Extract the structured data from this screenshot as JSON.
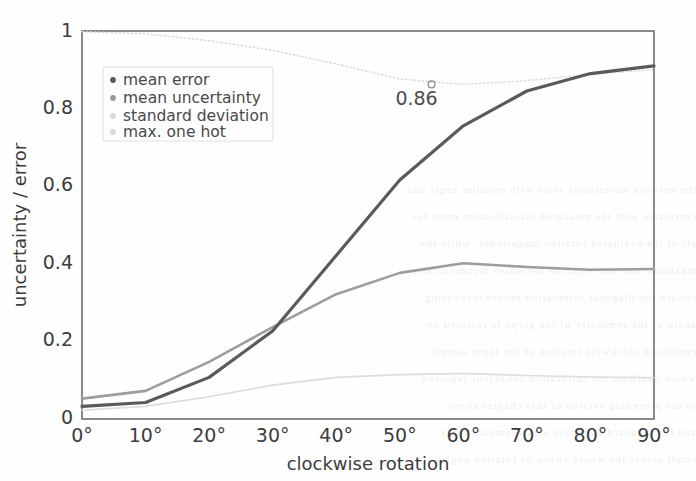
{
  "figure": {
    "background": "#fefefe",
    "frame_color": "#6d6d6d"
  },
  "chart_data": {
    "type": "line",
    "title": "",
    "subtitle": "",
    "xlabel": "clockwise rotation",
    "ylabel": "uncertainty / error",
    "xlim": [
      0,
      90
    ],
    "ylim": [
      0,
      1
    ],
    "x": [
      0,
      10,
      20,
      30,
      40,
      50,
      60,
      70,
      80,
      90
    ],
    "xtick_labels": [
      "0°",
      "10°",
      "20°",
      "30°",
      "40°",
      "50°",
      "60°",
      "70°",
      "80°",
      "90°"
    ],
    "ytick_values": [
      0,
      0.2,
      0.4,
      0.6,
      0.8,
      1
    ],
    "ytick_labels": [
      "0",
      "0.2",
      "0.4",
      "0.6",
      "0.8",
      "1"
    ],
    "grid": false,
    "legend_position": "upper left",
    "series": [
      {
        "name": "mean error",
        "color": "#5a5a5a",
        "linewidth": 3.2,
        "linestyle": "solid",
        "marker": "dot",
        "values": [
          0.03,
          0.04,
          0.105,
          0.225,
          0.42,
          0.615,
          0.755,
          0.845,
          0.89,
          0.91
        ]
      },
      {
        "name": "mean uncertainty",
        "color": "#9d9d9d",
        "linewidth": 2.6,
        "linestyle": "solid",
        "marker": "dot",
        "values": [
          0.05,
          0.07,
          0.145,
          0.235,
          0.32,
          0.375,
          0.4,
          0.39,
          0.383,
          0.385
        ]
      },
      {
        "name": "standard deviation",
        "color": "#dcdcdc",
        "linewidth": 1.6,
        "linestyle": "solid",
        "marker": "dot",
        "values": [
          0.02,
          0.03,
          0.055,
          0.085,
          0.105,
          0.112,
          0.115,
          0.11,
          0.106,
          0.104
        ]
      },
      {
        "name": "max. one hot",
        "color": "#dadada",
        "linewidth": 1.4,
        "linestyle": "dotted",
        "marker": "dot",
        "values": [
          0.998,
          0.993,
          0.975,
          0.95,
          0.915,
          0.876,
          0.862,
          0.872,
          0.888,
          0.9
        ]
      }
    ],
    "annotations": [
      {
        "label": "0.86",
        "x": 55,
        "y": 0.862,
        "marker": "open-circle",
        "marker_color": "#8e8e8e",
        "text_color": "#4c4c4c"
      }
    ]
  },
  "legend": {
    "entries": [
      {
        "label": "mean error",
        "color": "#5a5a5a"
      },
      {
        "label": "mean uncertainty",
        "color": "#9a9a9a"
      },
      {
        "label": "standard deviation",
        "color": "#d6d6d6"
      },
      {
        "label": "max. one hot",
        "color": "#d8d8d8"
      }
    ],
    "border_color": "#e2e2e2",
    "background": "#fdfdfd"
  },
  "ghost_text": {
    "lines": [
      "the network uncertainty rises with rotation angle and",
      "correlates with the measured classification error for",
      "all of the evaluated rotation magnitudes, while the",
      "maximum one hot response decreases monotonically",
      "toward the diagonal orientation before recovering",
      "again as the symmetry of the glyph is restored by",
      "continued clockwise rotation of the input sample",
      "which confirms the calibration behaviour reported",
      "in the preceding section of this chapter above",
      "and the standard deviation stays comparatively",
      "small across the whole sweep of rotation angles"
    ]
  }
}
